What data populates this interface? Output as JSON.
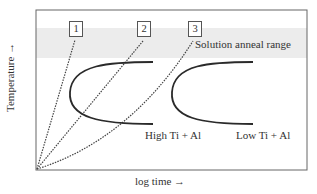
{
  "diagram": {
    "type": "TTT (time-temperature-transformation) schematic",
    "x_axis_label": "log time",
    "x_axis_arrow": "→",
    "y_axis_label": "Temperature",
    "y_axis_arrow": "→",
    "band_label": "Solution anneal range",
    "cooling_paths": [
      {
        "label": "1"
      },
      {
        "label": "2"
      },
      {
        "label": "3"
      }
    ],
    "c_curves": [
      {
        "label": "High Ti + Al"
      },
      {
        "label": "Low Ti + Al"
      }
    ],
    "colors": {
      "frame": "#666666",
      "band": "#ececec",
      "curve": "#2a2a2a",
      "dotted": "#444444"
    }
  }
}
